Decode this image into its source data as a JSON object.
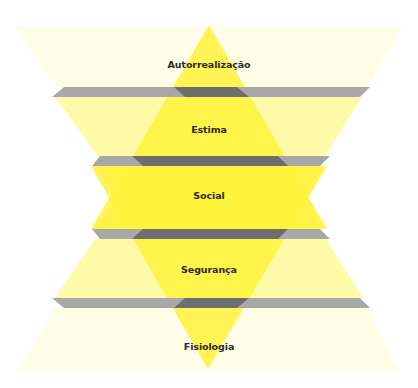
{
  "diagram": {
    "colors": {
      "strong_yellow": "#fff23a",
      "pale_yellow": "#fffab4",
      "faint_yellow": "#fffde8",
      "gray_slab": "#a6a6a6",
      "dark_slab": "#707070",
      "text": "#2b2b2b"
    },
    "levels": [
      {
        "label": "Autorrealização",
        "y": 66
      },
      {
        "label": "Estima",
        "y": 131
      },
      {
        "label": "Social",
        "y": 197
      },
      {
        "label": "Segurança",
        "y": 271
      },
      {
        "label": "Fisiologia",
        "y": 348
      }
    ]
  }
}
